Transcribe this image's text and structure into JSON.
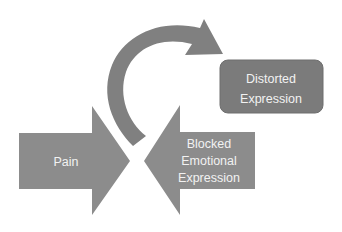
{
  "diagram": {
    "nodes": {
      "pain": {
        "label": "Pain"
      },
      "blocked": {
        "lines": [
          "Blocked",
          "Emotional",
          "Expression"
        ]
      },
      "distorted": {
        "lines": [
          "Distorted",
          "Expression"
        ]
      }
    },
    "edges": [
      {
        "from": "pain",
        "to": "center",
        "type": "block-arrow-right"
      },
      {
        "from": "blocked",
        "to": "center",
        "type": "block-arrow-left"
      },
      {
        "from": "center",
        "to": "distorted",
        "type": "curved-arrow"
      }
    ],
    "colors": {
      "arrow": "#8c8c8c",
      "box": "#7b7b7b",
      "curve": "#808080",
      "text": "#f2f2f2"
    }
  }
}
